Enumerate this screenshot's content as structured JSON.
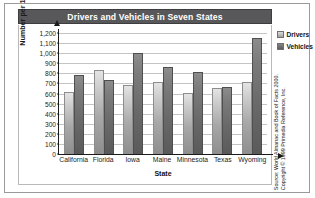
{
  "chart_data": {
    "type": "bar",
    "title": "Drivers and Vehicles in Seven States",
    "xlabel": "State",
    "ylabel": "Number per 1,000 people",
    "categories": [
      "California",
      "Florida",
      "Iowa",
      "Maine",
      "Minnesota",
      "Texas",
      "Wyoming"
    ],
    "series": [
      {
        "name": "Drivers",
        "values": [
          615,
          830,
          680,
          715,
          610,
          655,
          710
        ]
      },
      {
        "name": "Vehicles",
        "values": [
          780,
          735,
          1005,
          860,
          810,
          660,
          1155
        ]
      }
    ],
    "ylim": [
      0,
      1200
    ],
    "ytick_step": 100,
    "ytick_labels": [
      "1,200",
      "1,100",
      "1,000",
      "900",
      "800",
      "700",
      "600",
      "500",
      "400",
      "300",
      "200",
      "100",
      "0"
    ],
    "grid": true,
    "legend_position": "right",
    "colors": {
      "drivers": "#b8b8b8",
      "vehicles": "#6a6a6a",
      "title_bar": "#58585a",
      "title_text": "#ffffff",
      "gridline": "#c4c4c4",
      "axis": "#1b1b1b"
    }
  },
  "legend": {
    "items": [
      {
        "label": "Drivers"
      },
      {
        "label": "Vehicles"
      }
    ]
  },
  "source": {
    "line1": "Source: World Almanac and Book of Facts 2000.",
    "line2": "Copyright © 1999 Primedia Reference, Inc."
  }
}
